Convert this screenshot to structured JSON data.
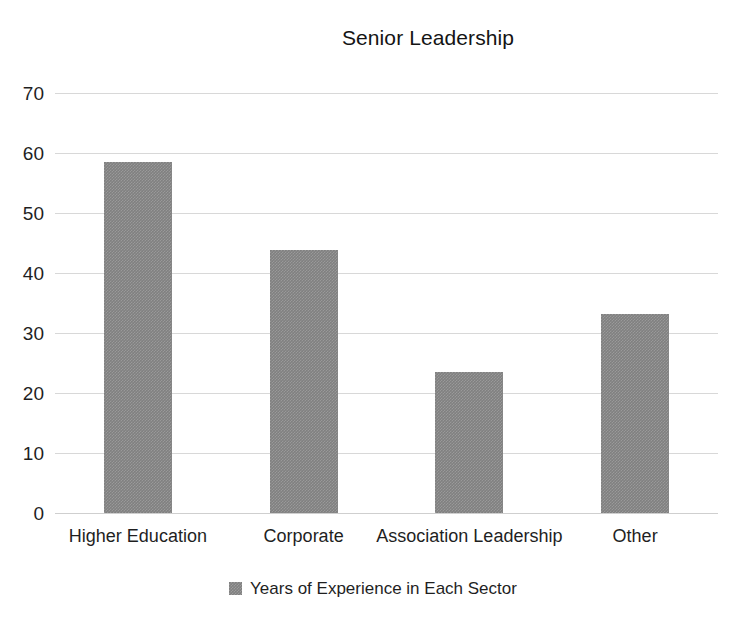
{
  "chart_data": {
    "type": "bar",
    "title": "Senior Leadership",
    "xlabel": "",
    "ylabel": "",
    "categories": [
      "Higher Education",
      "Corporate",
      "Association Leadership",
      "Other"
    ],
    "series": [
      {
        "name": "Years of Experience in Each Sector",
        "color": "#808080",
        "values": [
          58.5,
          43.8,
          23.5,
          33.2
        ]
      }
    ],
    "ylim": [
      0,
      70
    ],
    "yticks": [
      0,
      10,
      20,
      30,
      40,
      50,
      60,
      70
    ],
    "ytick_labels": [
      "0",
      "10",
      "20",
      "30",
      "40",
      "50",
      "60",
      "70"
    ],
    "grid": true,
    "grid_axis": "y",
    "legend": {
      "position": "bottom",
      "entries": [
        {
          "label": "Years of Experience in Each Sector",
          "swatch_color": "#808080"
        }
      ]
    },
    "background_color": "#ffffff",
    "gridline_color": "#d8d8d8"
  }
}
